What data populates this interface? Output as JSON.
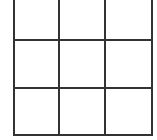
{
  "game": {
    "type": "tic-tac-toe",
    "rows": 3,
    "cols": 3,
    "cells": [
      "",
      "",
      "",
      "",
      "",
      "",
      "",
      "",
      ""
    ],
    "line_color": "#333333"
  }
}
